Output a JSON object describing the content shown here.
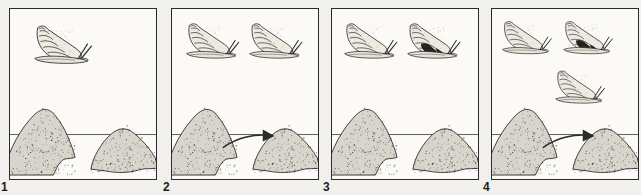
{
  "figure": {
    "background_color": "#f2f0ec",
    "panel_background_color": "#fbfaf7",
    "ink_color": "#2b2b2b",
    "dark_band_color": "#151515",
    "panel_count": 4
  },
  "panels": [
    {
      "number": "1",
      "snails": [
        {
          "name": "snail-light-left",
          "morph": "light",
          "x": 22,
          "y": 14,
          "scale": 1.0,
          "banded": false
        }
      ],
      "mounds": [
        {
          "name": "mound-left",
          "side": "left"
        },
        {
          "name": "mound-right",
          "side": "right"
        }
      ],
      "arrow": false,
      "waterline": true
    },
    {
      "number": "2",
      "snails": [
        {
          "name": "snail-light-left",
          "morph": "light",
          "x": 12,
          "y": 12,
          "scale": 0.92,
          "banded": false
        },
        {
          "name": "snail-light-right",
          "morph": "light",
          "x": 76,
          "y": 12,
          "scale": 0.92,
          "banded": false
        }
      ],
      "mounds": [
        {
          "name": "mound-left",
          "side": "left"
        },
        {
          "name": "mound-right",
          "side": "right"
        }
      ],
      "arrow": true,
      "waterline": true
    },
    {
      "number": "3",
      "snails": [
        {
          "name": "snail-light-left",
          "morph": "light",
          "x": 10,
          "y": 12,
          "scale": 0.92,
          "banded": false
        },
        {
          "name": "snail-banded-right",
          "morph": "banded",
          "x": 74,
          "y": 12,
          "scale": 0.92,
          "banded": true
        }
      ],
      "mounds": [
        {
          "name": "mound-left",
          "side": "left"
        },
        {
          "name": "mound-right",
          "side": "right"
        }
      ],
      "arrow": false,
      "waterline": true
    },
    {
      "number": "4",
      "snails": [
        {
          "name": "snail-light-left",
          "morph": "light",
          "x": 8,
          "y": 10,
          "scale": 0.86,
          "banded": false
        },
        {
          "name": "snail-banded-right",
          "morph": "banded",
          "x": 70,
          "y": 10,
          "scale": 0.86,
          "banded": true
        },
        {
          "name": "snail-light-lower-right",
          "morph": "light",
          "x": 62,
          "y": 60,
          "scale": 0.86,
          "banded": false
        }
      ],
      "mounds": [
        {
          "name": "mound-left",
          "side": "left"
        },
        {
          "name": "mound-right",
          "side": "right"
        }
      ],
      "arrow": true,
      "waterline": true
    }
  ]
}
